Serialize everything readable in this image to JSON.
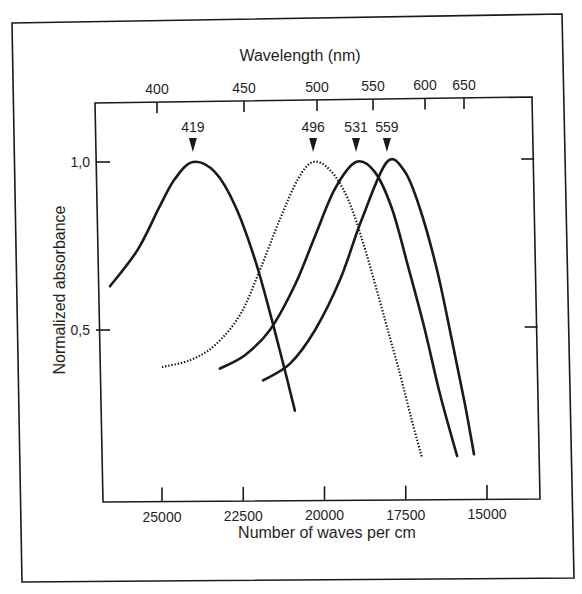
{
  "chart_data": {
    "type": "line",
    "title": "",
    "xlabel": "Number of waves per cm",
    "x2label": "Wavelength (nm)",
    "ylabel": "Normalized absorbance",
    "xlim": [
      27070,
      13500
    ],
    "ylim": [
      0,
      1.18
    ],
    "grid": false,
    "legend": "none",
    "x_ticks": [
      {
        "value": 25000,
        "label": "25000"
      },
      {
        "value": 22500,
        "label": "22500"
      },
      {
        "value": 20000,
        "label": "20000"
      },
      {
        "value": 17500,
        "label": "17500"
      },
      {
        "value": 15000,
        "label": "15000"
      }
    ],
    "x2_ticks": [
      {
        "value": 400,
        "label": "400"
      },
      {
        "value": 450,
        "label": "450"
      },
      {
        "value": 500,
        "label": "500"
      },
      {
        "value": 550,
        "label": "550"
      },
      {
        "value": 600,
        "label": "600"
      },
      {
        "value": 650,
        "label": "650"
      }
    ],
    "y_ticks": [
      {
        "value": 1.0,
        "label": "1.0"
      },
      {
        "value": 0.5,
        "label": "0.5"
      }
    ],
    "annotations": [
      {
        "label": "419",
        "peak_nm": 419
      },
      {
        "label": "496",
        "peak_nm": 496
      },
      {
        "label": "531",
        "peak_nm": 531
      },
      {
        "label": "559",
        "peak_nm": 559
      }
    ],
    "series": [
      {
        "name": "419",
        "style": "solid",
        "x": [
          26600,
          25740,
          25060,
          24600,
          24050,
          23370,
          22750,
          22140,
          21620,
          21220,
          20910
        ],
        "y": [
          0.63,
          0.74,
          0.87,
          0.95,
          1.0,
          0.97,
          0.87,
          0.71,
          0.53,
          0.38,
          0.26
        ]
      },
      {
        "name": "496",
        "style": "dotted",
        "x": [
          25000,
          24140,
          23370,
          22600,
          21980,
          21370,
          20810,
          20350,
          19830,
          19280,
          18750,
          18140,
          17680,
          17310,
          17000
        ],
        "y": [
          0.39,
          0.41,
          0.455,
          0.545,
          0.68,
          0.83,
          0.95,
          1.0,
          0.976,
          0.89,
          0.74,
          0.53,
          0.37,
          0.23,
          0.12
        ]
      },
      {
        "name": "531",
        "style": "solid",
        "x": [
          23220,
          22450,
          21680,
          20910,
          20290,
          19680,
          19030,
          18450,
          17920,
          17430,
          16910,
          16450,
          15920
        ],
        "y": [
          0.385,
          0.425,
          0.5,
          0.634,
          0.78,
          0.92,
          1.0,
          0.97,
          0.86,
          0.69,
          0.5,
          0.31,
          0.125
        ]
      },
      {
        "name": "559",
        "style": "solid",
        "x": [
          21890,
          21060,
          20290,
          19520,
          18850,
          18080,
          17520,
          17060,
          16540,
          16080,
          15680,
          15400
        ],
        "y": [
          0.35,
          0.4,
          0.5,
          0.65,
          0.83,
          1.0,
          0.97,
          0.86,
          0.68,
          0.47,
          0.28,
          0.13
        ]
      }
    ]
  },
  "labels": {
    "top_axis_title": "Wavelength (nm)",
    "bottom_axis_title": "Number of waves per cm",
    "y_axis_title": "Normalized absorbance"
  }
}
